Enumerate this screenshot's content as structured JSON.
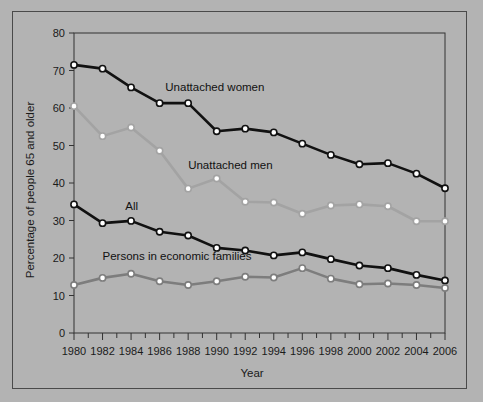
{
  "figure": {
    "background_color": "#b3b3b3",
    "frame_color": "#4a4a4a",
    "axis_color": "#333333"
  },
  "chart_data": {
    "type": "line",
    "title": "",
    "xlabel": "Year",
    "ylabel": "Percentage of people 65 and older",
    "xlim": [
      1980,
      2006
    ],
    "ylim": [
      0,
      80
    ],
    "grid": false,
    "legend_position": "inline-annotations",
    "x": [
      1980,
      1981,
      1982,
      1983,
      1984,
      1985,
      1986,
      1987,
      1988,
      1989,
      1990,
      1991,
      1992,
      1993,
      1994,
      1995,
      1996,
      1997,
      1998,
      1999,
      2000,
      2001,
      2002,
      2003,
      2004,
      2005,
      2006
    ],
    "x_tick_values": [
      1980,
      1982,
      1984,
      1986,
      1988,
      1990,
      1992,
      1994,
      1996,
      1998,
      2000,
      2002,
      2004,
      2006
    ],
    "x_tick_labels": [
      "1980",
      "1982",
      "1984",
      "1986",
      "1988",
      "1990",
      "1992",
      "1994",
      "1996",
      "1998",
      "2000",
      "2002",
      "2004",
      "2006"
    ],
    "y_tick_values": [
      0,
      10,
      20,
      30,
      40,
      50,
      60,
      70,
      80
    ],
    "y_tick_labels": [
      "0",
      "10",
      "20",
      "30",
      "40",
      "50",
      "60",
      "70",
      "80"
    ],
    "series": [
      {
        "name": "Unattached women",
        "label": "Unattached women",
        "color": "#111111",
        "marker": "circle-open-white",
        "x": [
          1980,
          1982,
          1984,
          1986,
          1988,
          1990,
          1992,
          1994,
          1996,
          1998,
          2000,
          2002,
          2004,
          2006
        ],
        "values": [
          71.5,
          70.5,
          65.5,
          61.3,
          61.3,
          53.8,
          54.5,
          53.5,
          50.5,
          47.5,
          45.0,
          45.3,
          42.5,
          38.6
        ],
        "annotation": {
          "text": "Unattached women",
          "x": 1986.4,
          "y": 64.5
        }
      },
      {
        "name": "Unattached men",
        "label": "Unattached men",
        "color": "#a3a3a3",
        "marker": "circle-open-white",
        "x": [
          1980,
          1982,
          1984,
          1986,
          1988,
          1990,
          1992,
          1994,
          1996,
          1998,
          2000,
          2002,
          2004,
          2006
        ],
        "values": [
          60.5,
          52.5,
          54.8,
          48.6,
          38.5,
          41.2,
          35.0,
          34.8,
          31.8,
          34.0,
          34.3,
          33.8,
          29.8,
          29.8
        ],
        "annotation": {
          "text": "Unattached men",
          "x": 1988.0,
          "y": 43.8
        }
      },
      {
        "name": "All",
        "label": "All",
        "color": "#111111",
        "marker": "circle-open-white",
        "x": [
          1980,
          1982,
          1984,
          1986,
          1988,
          1990,
          1992,
          1994,
          1996,
          1998,
          2000,
          2002,
          2004,
          2006
        ],
        "values": [
          34.3,
          29.3,
          29.9,
          27.0,
          26.0,
          22.7,
          22.0,
          20.7,
          21.5,
          19.7,
          18.0,
          17.3,
          15.5,
          14.0
        ],
        "annotation": {
          "text": "All",
          "x": 1983.6,
          "y": 32.8
        }
      },
      {
        "name": "Persons in economic families",
        "label": "Persons in economic families",
        "color": "#7d7d7d",
        "marker": "circle-open-white",
        "x": [
          1980,
          1982,
          1984,
          1986,
          1988,
          1990,
          1992,
          1994,
          1996,
          1998,
          2000,
          2002,
          2004,
          2006
        ],
        "values": [
          12.8,
          14.7,
          15.8,
          13.8,
          12.8,
          13.8,
          15.0,
          14.8,
          17.3,
          14.5,
          13.0,
          13.2,
          12.8,
          12.0
        ],
        "annotation": {
          "text": "Persons in economic families",
          "x": 1982.0,
          "y": 19.6
        }
      }
    ]
  }
}
